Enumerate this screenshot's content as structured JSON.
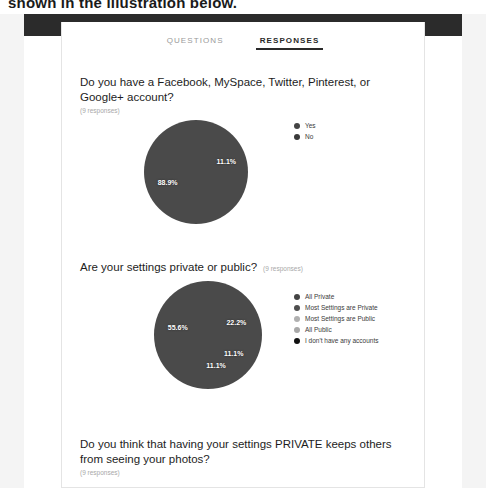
{
  "page": {
    "caption": "shown in the illustration below."
  },
  "tabs": [
    {
      "label": "QUESTIONS",
      "active": false
    },
    {
      "label": "RESPONSES",
      "active": true
    }
  ],
  "questions": [
    {
      "title": "Do you have a Facebook, MySpace, Twitter, Pinterest, or Google+ account?",
      "responses": "(9 responses)",
      "count_inline": false,
      "has_chart": true
    },
    {
      "title": "Are your settings private or public?",
      "responses": "(9 responses)",
      "count_inline": true,
      "has_chart": true
    },
    {
      "title": "Do you think that having your settings PRIVATE keeps others from seeing your photos?",
      "responses": "(9 responses)",
      "count_inline": false,
      "has_chart": false
    }
  ],
  "chart_data": [
    {
      "type": "pie",
      "title": "Do you have a Facebook, MySpace, Twitter, Pinterest, or Google+ account?",
      "subtitle": "(9 responses)",
      "legend_position": "right",
      "categories": [
        "Yes",
        "No"
      ],
      "values": [
        88.9,
        11.1
      ],
      "labels": [
        "88.9%",
        "11.1%"
      ],
      "counts": [
        8,
        1
      ],
      "total_responses": 9,
      "colors": [
        "#4a4a4a",
        "#3d3d3d"
      ],
      "legend_colors": [
        "#444444",
        "#3a3a3a"
      ]
    },
    {
      "type": "pie",
      "title": "Are your settings private or public?",
      "subtitle": "(9 responses)",
      "legend_position": "right",
      "categories": [
        "All Private",
        "Most Settings are Private",
        "Most Settings are Public",
        "All Public",
        "I don't have any accounts"
      ],
      "values": [
        55.6,
        22.2,
        11.1,
        11.1,
        0.0
      ],
      "labels": [
        "55.6%",
        "22.2%",
        "11.1%",
        "11.1%",
        ""
      ],
      "counts": [
        5,
        2,
        1,
        1,
        0
      ],
      "total_responses": 9,
      "colors": [
        "#4a4a4a",
        "#565656",
        "#151515",
        "#8c8c8c",
        "#000000"
      ],
      "legend_colors": [
        "#444444",
        "#4e4e4e",
        "#b0b0b0",
        "#a8a8a8",
        "#111111"
      ]
    }
  ]
}
